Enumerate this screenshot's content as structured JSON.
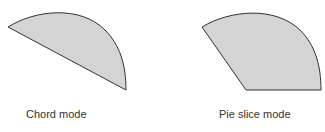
{
  "figures": [
    {
      "label": "Chord mode",
      "fill": "#d4d4d4",
      "stroke": "#333333"
    },
    {
      "label": "Pie slice mode",
      "fill": "#d4d4d4",
      "stroke": "#333333"
    }
  ]
}
